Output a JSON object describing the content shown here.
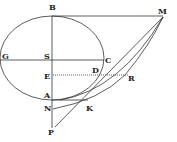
{
  "diagram": {
    "type": "geometric-figure",
    "labels": {
      "B": "B",
      "M": "M",
      "G": "G",
      "S": "S",
      "C": "C",
      "E": "E",
      "D": "D",
      "R": "R",
      "A": "A",
      "N": "N",
      "K": "K",
      "P": "P"
    },
    "colors": {
      "ink": "#333333",
      "background": "#ffffff"
    }
  }
}
